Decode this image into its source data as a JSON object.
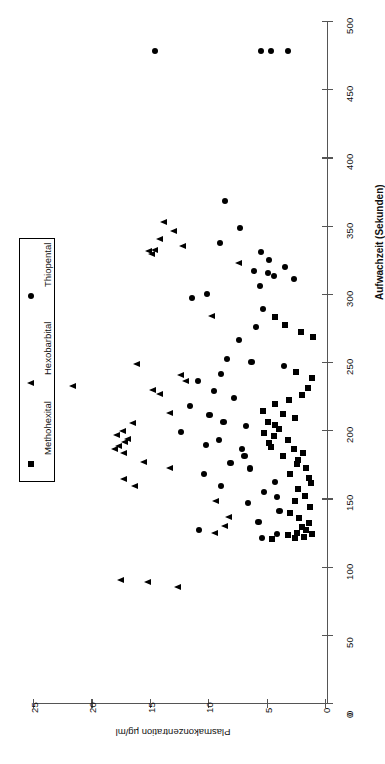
{
  "chart_data": {
    "type": "scatter",
    "title": "",
    "orientation": "rotated-90-ccw",
    "xlabel": "Aufwachzeit (Sekunden)",
    "ylabel": "Plasmakonzentration µg/ml",
    "xlim": [
      0,
      500
    ],
    "ylim": [
      0,
      25
    ],
    "xticks": [
      0,
      50,
      100,
      150,
      200,
      250,
      300,
      350,
      400,
      450,
      500
    ],
    "yticks": [
      0,
      5,
      10,
      15,
      20,
      25
    ],
    "xticklabels": [
      "0",
      "50",
      "100",
      "150",
      "200",
      "250",
      "300",
      "350",
      "400",
      "450",
      "500"
    ],
    "yticklabels": [
      "0",
      "5",
      "10",
      "15",
      "20",
      "25"
    ],
    "grid": false,
    "legend_position": "left-middle",
    "series": [
      {
        "name": "Methohexital",
        "marker": "square",
        "color": "#000000",
        "points": [
          [
            283,
            4.3
          ],
          [
            277,
            3.4
          ],
          [
            272,
            2.1
          ],
          [
            268,
            1.0
          ],
          [
            243,
            2.5
          ],
          [
            238,
            1.1
          ],
          [
            231,
            1.5
          ],
          [
            226,
            2.0
          ],
          [
            222,
            3.1
          ],
          [
            219,
            4.3
          ],
          [
            214,
            5.3
          ],
          [
            212,
            3.6
          ],
          [
            209,
            2.6
          ],
          [
            206,
            4.9
          ],
          [
            204,
            4.3
          ],
          [
            201,
            3.9
          ],
          [
            198,
            5.2
          ],
          [
            196,
            4.4
          ],
          [
            193,
            3.2
          ],
          [
            191,
            4.8
          ],
          [
            188,
            4.6
          ],
          [
            186,
            2.7
          ],
          [
            183,
            1.9
          ],
          [
            181,
            3.6
          ],
          [
            178,
            2.3
          ],
          [
            175,
            2.4
          ],
          [
            172,
            1.6
          ],
          [
            168,
            3.0
          ],
          [
            165,
            1.4
          ],
          [
            161,
            1.2
          ],
          [
            157,
            2.3
          ],
          [
            152,
            1.7
          ],
          [
            148,
            2.6
          ],
          [
            144,
            1.3
          ],
          [
            139,
            3.0
          ],
          [
            136,
            2.2
          ],
          [
            132,
            1.4
          ],
          [
            129,
            2.0
          ],
          [
            127,
            1.6
          ],
          [
            125,
            2.4
          ],
          [
            124,
            1.1
          ],
          [
            123,
            3.2
          ],
          [
            122,
            1.8
          ],
          [
            121,
            2.6
          ],
          [
            120,
            4.5
          ]
        ]
      },
      {
        "name": "Hexobarbital",
        "marker": "triangle",
        "color": "#000000",
        "points": [
          [
            352,
            13.8
          ],
          [
            346,
            12.9
          ],
          [
            340,
            14.1
          ],
          [
            335,
            12.2
          ],
          [
            332,
            14.6
          ],
          [
            331,
            15.1
          ],
          [
            329,
            14.8
          ],
          [
            322,
            7.4
          ],
          [
            283,
            9.7
          ],
          [
            248,
            16.1
          ],
          [
            240,
            12.3
          ],
          [
            236,
            11.9
          ],
          [
            232,
            21.6
          ],
          [
            229,
            14.7
          ],
          [
            226,
            14.1
          ],
          [
            212,
            13.3
          ],
          [
            205,
            16.4
          ],
          [
            199,
            17.3
          ],
          [
            196,
            17.8
          ],
          [
            193,
            16.9
          ],
          [
            191,
            17.1
          ],
          [
            188,
            17.6
          ],
          [
            186,
            18.0
          ],
          [
            183,
            17.2
          ],
          [
            176,
            15.5
          ],
          [
            172,
            13.3
          ],
          [
            164,
            17.2
          ],
          [
            159,
            16.3
          ],
          [
            148,
            9.3
          ],
          [
            136,
            8.2
          ],
          [
            129,
            8.6
          ],
          [
            124,
            9.4
          ],
          [
            90,
            17.5
          ],
          [
            88,
            15.2
          ],
          [
            85,
            12.6
          ]
        ]
      },
      {
        "name": "Thiopental",
        "marker": "circle",
        "color": "#000000",
        "points": [
          [
            478,
            14.6
          ],
          [
            478,
            5.5
          ],
          [
            478,
            4.6
          ],
          [
            478,
            3.2
          ],
          [
            368,
            8.6
          ],
          [
            348,
            7.3
          ],
          [
            337,
            9.0
          ],
          [
            331,
            5.5
          ],
          [
            325,
            4.8
          ],
          [
            320,
            3.4
          ],
          [
            317,
            6.1
          ],
          [
            315,
            4.9
          ],
          [
            313,
            4.4
          ],
          [
            311,
            2.7
          ],
          [
            306,
            5.6
          ],
          [
            300,
            10.1
          ],
          [
            297,
            11.4
          ],
          [
            289,
            5.3
          ],
          [
            276,
            5.9
          ],
          [
            266,
            7.4
          ],
          [
            252,
            8.4
          ],
          [
            250,
            6.3
          ],
          [
            247,
            3.5
          ],
          [
            241,
            8.9
          ],
          [
            236,
            10.9
          ],
          [
            229,
            9.5
          ],
          [
            224,
            7.8
          ],
          [
            218,
            11.6
          ],
          [
            211,
            9.9
          ],
          [
            206,
            8.7
          ],
          [
            203,
            6.8
          ],
          [
            199,
            12.3
          ],
          [
            193,
            9.1
          ],
          [
            189,
            10.2
          ],
          [
            186,
            7.1
          ],
          [
            181,
            6.9
          ],
          [
            176,
            8.1
          ],
          [
            172,
            6.4
          ],
          [
            168,
            10.4
          ],
          [
            162,
            4.3
          ],
          [
            159,
            8.9
          ],
          [
            155,
            5.2
          ],
          [
            151,
            4.1
          ],
          [
            147,
            6.6
          ],
          [
            141,
            3.9
          ],
          [
            133,
            5.7
          ],
          [
            127,
            10.8
          ],
          [
            124,
            4.1
          ],
          [
            121,
            5.4
          ]
        ]
      }
    ]
  },
  "legend": {
    "entries": [
      {
        "label": "Methohexital",
        "marker": "square"
      },
      {
        "label": "Hexobarbital",
        "marker": "triangle"
      },
      {
        "label": "Thiopental",
        "marker": "circle"
      }
    ]
  },
  "axes": {
    "x_axis_title": "Aufwachzeit (Sekunden)",
    "y_axis_title": "Plasmakonzentration µg/ml",
    "origin_label": "0"
  }
}
